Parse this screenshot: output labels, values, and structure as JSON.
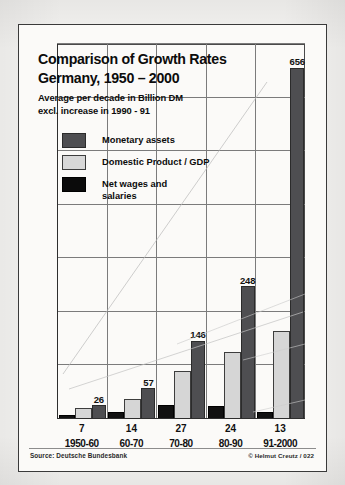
{
  "chart_data": {
    "type": "bar",
    "title": "Comparison of Growth Rates\nGermany, 1950 – 2000",
    "title_line1": "Comparison of Growth Rates",
    "title_line2": "Germany, 1950 – 2000",
    "subtitle_line1": "Average per decade in Billion DM",
    "subtitle_line2": "excl. increase in  1990 - 91",
    "xlabel": "",
    "ylabel": "",
    "ylim": [
      0,
      700
    ],
    "grid": true,
    "grid_h_values": [
      100,
      200,
      300,
      400,
      500,
      600,
      700
    ],
    "legend_position": "upper-left-inside",
    "categories": [
      "1950-60",
      "60-70",
      "70-80",
      "80-90",
      "91-2000"
    ],
    "series": [
      {
        "name": "Net wages and\nsalaries",
        "name_flat": "Net wages and salaries",
        "color": "#0b0b0b",
        "values": [
          7,
          14,
          27,
          24,
          13
        ],
        "labels": [
          "7",
          "14",
          "27",
          "24",
          "13"
        ],
        "labels_shown": false
      },
      {
        "name": "Domestic Product / GDP",
        "name_flat": "Domestic Product / GDP",
        "color": "#d8d8d8",
        "values": [
          20,
          37,
          90,
          125,
          165
        ],
        "labels": [
          "",
          "",
          "",
          "",
          ""
        ],
        "labels_shown": false
      },
      {
        "name": "Monetary assets",
        "name_flat": "Monetary assets",
        "color": "#4e4e51",
        "values": [
          26,
          57,
          146,
          248,
          656
        ],
        "labels": [
          "26",
          "57",
          "146",
          "248",
          "656"
        ],
        "labels_shown": true
      }
    ],
    "x_value_row": [
      "7",
      "14",
      "27",
      "24",
      "13"
    ],
    "source": "Source: Deutsche Bundesbank",
    "copyright": "© Helmut Creutz / 022"
  }
}
